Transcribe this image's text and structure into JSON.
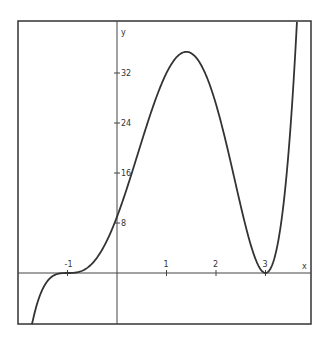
{
  "chart_data": {
    "type": "line",
    "title": "",
    "xlabel": "x",
    "ylabel": "y",
    "function": "y = (x+1)^3 (x-3)^2",
    "xlim": [
      -2.0,
      3.9
    ],
    "ylim": [
      -8.2,
      40.3
    ],
    "x_ticks": [
      -1,
      1,
      2,
      3
    ],
    "x_tick_labels": [
      "-1",
      "1",
      "2",
      "3"
    ],
    "y_ticks": [
      8,
      16,
      24,
      32
    ],
    "y_tick_labels": [
      "8",
      "16",
      "24",
      "32"
    ],
    "grid": false,
    "legend": null,
    "series": [
      {
        "name": "f(x)",
        "color": "#333333",
        "x": [
          -1.72,
          -1.5,
          -1.25,
          -1.0,
          -0.75,
          -0.5,
          -0.25,
          0.0,
          0.25,
          0.5,
          0.75,
          1.0,
          1.25,
          1.4,
          1.5,
          1.75,
          2.0,
          2.25,
          2.5,
          2.75,
          3.0,
          3.25,
          3.5,
          3.635
        ],
        "values": [
          -8.2,
          -2.5,
          -0.2,
          0.0,
          0.1,
          0.8,
          2.6,
          9.0,
          14.8,
          21.1,
          27.0,
          32.0,
          34.8,
          35.4,
          35.2,
          32.2,
          27.0,
          19.6,
          10.7,
          3.1,
          0.0,
          1.9,
          10.7,
          40.3
        ]
      }
    ]
  },
  "axes": {
    "x_label": "x",
    "y_label": "y"
  }
}
